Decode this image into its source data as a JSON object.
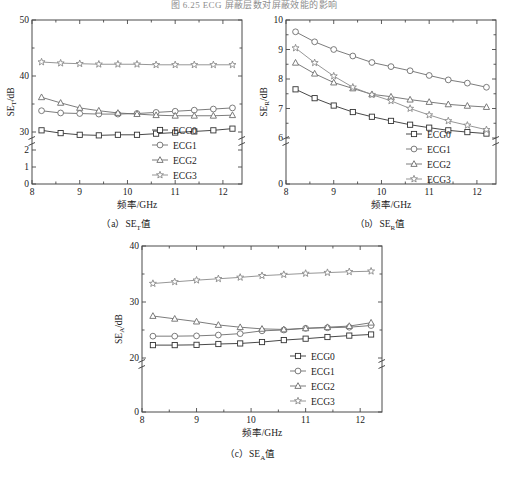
{
  "figure": {
    "top_caption": "图 6.25  ECG 屏蔽层数对屏蔽效能的影响",
    "sub_captions": [
      {
        "id": "a",
        "prefix": "（a）",
        "symbol": "SE",
        "sub": "T",
        "suffix": "值"
      },
      {
        "id": "b",
        "prefix": "（b）",
        "symbol": "SE",
        "sub": "R",
        "suffix": "值"
      },
      {
        "id": "c",
        "prefix": "（c）",
        "symbol": "SE",
        "sub": "A",
        "suffix": "值"
      }
    ]
  },
  "common": {
    "xlabel": "频率/GHz",
    "legend": [
      "ECG0",
      "ECG1",
      "ECG2",
      "ECG3"
    ],
    "markers": [
      "square-marker",
      "circle-marker",
      "triangle-marker",
      "star-marker"
    ],
    "colors": [
      "#333333",
      "#6d6d6d",
      "#6d6d6d",
      "#8a8a8a"
    ],
    "xticks": [
      8,
      9,
      10,
      11,
      12
    ],
    "xlim": [
      8,
      12.4
    ],
    "x": [
      8.2,
      8.6,
      9.0,
      9.4,
      9.8,
      10.2,
      10.6,
      11.0,
      11.4,
      11.8,
      12.2
    ]
  },
  "chart_data": [
    {
      "id": "a",
      "type": "line",
      "title": "（a）SE_T值",
      "xlabel": "频率/GHz",
      "ylabel": "SE_T/dB",
      "ylabel_symbol": "SE",
      "ylabel_sub": "T",
      "ylabel_unit": "/dB",
      "xlim": [
        8,
        12.4
      ],
      "xticks": [
        8,
        9,
        10,
        11,
        12
      ],
      "yticks_lower": [
        0,
        1,
        2
      ],
      "yticks_upper": [
        30,
        40,
        50
      ],
      "axis_break": true,
      "grid": false,
      "legend_position": "bottom-right",
      "categories": [
        8.2,
        8.6,
        9.0,
        9.4,
        9.8,
        10.2,
        10.6,
        11.0,
        11.4,
        11.8,
        12.2
      ],
      "series": [
        {
          "name": "ECG0",
          "marker": "square-marker",
          "values": [
            30.3,
            29.8,
            29.5,
            29.4,
            29.5,
            29.5,
            29.7,
            29.9,
            30.1,
            30.3,
            30.6
          ]
        },
        {
          "name": "ECG1",
          "marker": "circle-marker",
          "values": [
            33.8,
            33.4,
            33.3,
            33.2,
            33.2,
            33.3,
            33.5,
            33.7,
            33.9,
            34.1,
            34.3
          ]
        },
        {
          "name": "ECG2",
          "marker": "triangle-marker",
          "values": [
            36.2,
            35.2,
            34.3,
            33.8,
            33.4,
            33.2,
            33.0,
            32.9,
            32.9,
            32.9,
            33.0
          ]
        },
        {
          "name": "ECG3",
          "marker": "star-marker",
          "values": [
            42.5,
            42.3,
            42.2,
            42.1,
            42.1,
            42.1,
            42.0,
            42.0,
            42.0,
            42.0,
            42.0
          ]
        }
      ]
    },
    {
      "id": "b",
      "type": "line",
      "title": "（b）SE_R值",
      "xlabel": "频率/GHz",
      "ylabel": "SE_R/dB",
      "ylabel_symbol": "SE",
      "ylabel_sub": "R",
      "ylabel_unit": "/dB",
      "xlim": [
        8,
        12.4
      ],
      "xticks": [
        8,
        9,
        10,
        11,
        12
      ],
      "yticks_lower": [
        0
      ],
      "yticks_upper": [
        6,
        7,
        8,
        9,
        10
      ],
      "axis_break": true,
      "grid": false,
      "legend_position": "bottom-right",
      "categories": [
        8.2,
        8.6,
        9.0,
        9.4,
        9.8,
        10.2,
        10.6,
        11.0,
        11.4,
        11.8,
        12.2
      ],
      "series": [
        {
          "name": "ECG0",
          "marker": "square-marker",
          "values": [
            7.65,
            7.35,
            7.1,
            6.88,
            6.72,
            6.58,
            6.45,
            6.35,
            6.26,
            6.2,
            6.15
          ]
        },
        {
          "name": "ECG1",
          "marker": "circle-marker",
          "values": [
            9.6,
            9.26,
            9.0,
            8.78,
            8.56,
            8.42,
            8.28,
            8.12,
            7.97,
            7.86,
            7.72
          ]
        },
        {
          "name": "ECG2",
          "marker": "triangle-marker",
          "values": [
            8.55,
            8.18,
            7.88,
            7.68,
            7.48,
            7.4,
            7.3,
            7.22,
            7.14,
            7.09,
            7.05
          ]
        },
        {
          "name": "ECG3",
          "marker": "star-marker",
          "values": [
            9.05,
            8.55,
            8.1,
            7.72,
            7.47,
            7.26,
            7.0,
            6.78,
            6.58,
            6.43,
            6.28
          ]
        }
      ]
    },
    {
      "id": "c",
      "type": "line",
      "title": "（c）SE_A值",
      "xlabel": "频率/GHz",
      "ylabel": "SE_A/dB",
      "ylabel_symbol": "SE",
      "ylabel_sub": "A",
      "ylabel_unit": "/dB",
      "xlim": [
        8,
        12.4
      ],
      "xticks": [
        8,
        9,
        10,
        11,
        12
      ],
      "yticks_lower": [
        0
      ],
      "yticks_upper": [
        20,
        30,
        40
      ],
      "axis_break": true,
      "grid": false,
      "legend_position": "bottom-right",
      "categories": [
        8.2,
        8.6,
        9.0,
        9.4,
        9.8,
        10.2,
        10.6,
        11.0,
        11.4,
        11.8,
        12.2
      ],
      "series": [
        {
          "name": "ECG0",
          "marker": "square-marker",
          "values": [
            22.3,
            22.3,
            22.35,
            22.5,
            22.6,
            22.85,
            23.2,
            23.45,
            23.75,
            24.0,
            24.2
          ]
        },
        {
          "name": "ECG1",
          "marker": "circle-marker",
          "values": [
            23.9,
            23.9,
            23.95,
            24.1,
            24.35,
            24.85,
            25.0,
            25.3,
            25.4,
            25.5,
            25.8
          ]
        },
        {
          "name": "ECG2",
          "marker": "triangle-marker",
          "values": [
            27.5,
            27.0,
            26.5,
            25.9,
            25.5,
            25.2,
            25.1,
            25.3,
            25.5,
            25.7,
            26.3
          ]
        },
        {
          "name": "ECG3",
          "marker": "star-marker",
          "values": [
            33.3,
            33.6,
            33.9,
            34.15,
            34.4,
            34.7,
            34.9,
            35.1,
            35.25,
            35.4,
            35.5
          ]
        }
      ]
    }
  ]
}
